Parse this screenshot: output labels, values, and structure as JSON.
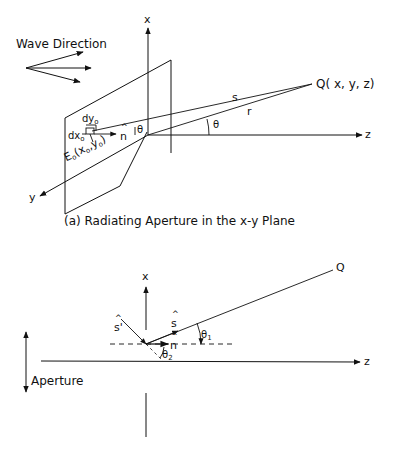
{
  "figure_a": {
    "wave_direction_label": "Wave Direction",
    "axis_x": "x",
    "axis_y": "y",
    "axis_z": "z",
    "point_q": "Q( x, y, z)",
    "label_s": "s",
    "label_r": "r",
    "label_theta": "θ",
    "label_theta_small": "θ",
    "label_n": "n",
    "label_dy": "dy",
    "label_dy_sub": "o",
    "label_dx": "dx",
    "label_dx_sub": "o",
    "label_e": "E",
    "label_e_sub": "o",
    "label_e_args": "(x",
    "label_e_args_sub1": "o",
    "label_e_args_mid": ",y",
    "label_e_args_sub2": "o",
    "label_e_args_end": ")",
    "caption": "(a) Radiating Aperture in the x-y Plane"
  },
  "figure_b": {
    "axis_x": "x",
    "axis_z": "z",
    "point_q": "Q",
    "label_s": "s",
    "label_s_prime": "s'",
    "label_n": "n",
    "label_theta1": "θ",
    "label_theta1_sub": "1",
    "label_theta2": "θ",
    "label_theta2_sub": "2",
    "aperture_label": "Aperture"
  }
}
